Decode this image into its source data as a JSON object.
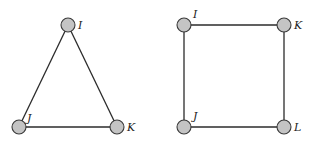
{
  "graphs": [
    {
      "name": "triangle",
      "nodes": [
        {
          "id": "I",
          "label": "I",
          "x": 68,
          "y": 25,
          "lx": 78,
          "ly": 29
        },
        {
          "id": "J",
          "label": "J",
          "x": 19,
          "y": 127,
          "lx": 27,
          "ly": 122
        },
        {
          "id": "K",
          "label": "K",
          "x": 117,
          "y": 127,
          "lx": 127,
          "ly": 131
        }
      ],
      "edges": [
        [
          "I",
          "J"
        ],
        [
          "I",
          "K"
        ],
        [
          "J",
          "K"
        ]
      ]
    },
    {
      "name": "square",
      "nodes": [
        {
          "id": "I",
          "label": "I",
          "x": 184,
          "y": 25,
          "lx": 193,
          "ly": 18
        },
        {
          "id": "K",
          "label": "K",
          "x": 284,
          "y": 25,
          "lx": 294,
          "ly": 29
        },
        {
          "id": "J",
          "label": "J",
          "x": 184,
          "y": 127,
          "lx": 193,
          "ly": 120
        },
        {
          "id": "L",
          "label": "L",
          "x": 284,
          "y": 127,
          "lx": 294,
          "ly": 131
        }
      ],
      "edges": [
        [
          "I",
          "K"
        ],
        [
          "I",
          "J"
        ],
        [
          "K",
          "L"
        ],
        [
          "J",
          "L"
        ]
      ]
    }
  ],
  "style": {
    "node_fill": "#c4c4c4",
    "node_stroke": "#3a3a3a",
    "edge_color": "#2b2b2b",
    "node_radius": 7
  }
}
